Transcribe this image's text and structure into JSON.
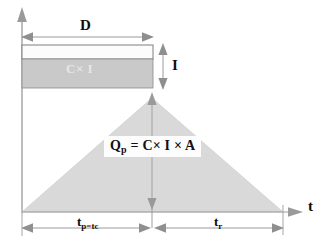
{
  "figure": {
    "axes": {
      "vertical_axis_name": "discharge-axis",
      "horizontal_axis_label": "t",
      "horizontal_axis_name": "time-axis"
    },
    "rainfall_block": {
      "duration_label": "D",
      "intensity_label": "I",
      "block_label": "C× I"
    },
    "hydrograph": {
      "peak_formula": "Q",
      "peak_formula_sub": "p",
      "peak_formula_rest": " = C× I × A",
      "rising_limb_label": "t",
      "rising_limb_sub": "p=t",
      "rising_limb_sub2": "c",
      "rising_limb_full": "tp=tc",
      "recession_limb_label": "t",
      "recession_limb_sub": "r",
      "recession_limb_full": "tr"
    },
    "colors": {
      "line": "#8c8c8c",
      "arrow": "#9a9a9a",
      "block_fill": "#c9c9c9",
      "block_top_fill": "#fcfcfc",
      "triangle_fill": "#d9d9d9",
      "text": "#0d0d0d",
      "block_text": "#e6e6e6",
      "background": "#ffffff"
    },
    "geometry": {
      "vaxis_x": 22,
      "baseline_y": 212,
      "d_line_y": 37,
      "block_left": 22,
      "block_right": 153,
      "block_top": 45,
      "block_mid": 59,
      "block_bottom": 88,
      "peak_x": 152,
      "peak_y": 97,
      "triangle_right_x": 283,
      "dim_line_y": 228
    }
  }
}
